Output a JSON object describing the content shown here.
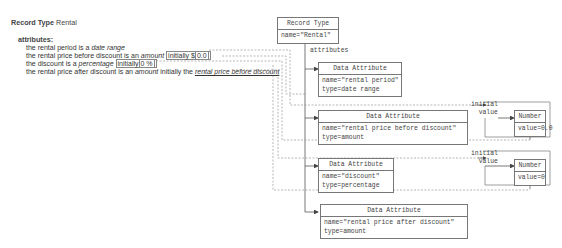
{
  "text_side": {
    "title_prefix": "Record Type",
    "title_name": "Rental",
    "attributes_heading": "attributes:",
    "lines": [
      {
        "pre": "the rental period is a ",
        "type": "date range"
      },
      {
        "pre": "the rental price before discount is an ",
        "type": "amount",
        "initially": "initially $",
        "value": "0.0"
      },
      {
        "pre": "the discount is a ",
        "type": "percentage",
        "initially": "initially",
        "value": "0 %"
      },
      {
        "pre": "the rental price after discount is an ",
        "type": "amount",
        "initially": "initially the ",
        "ref": "rental price before discount"
      }
    ]
  },
  "diagram": {
    "record_type": {
      "header": "Record Type",
      "body": "name=\"Rental\""
    },
    "attributes_label": "attributes",
    "initial_value_label_1": "initial",
    "initial_value_label_2": "value",
    "data_attributes": [
      {
        "header": "Data Attribute",
        "name": "name=\"rental period\"",
        "type": "type=date range"
      },
      {
        "header": "Data Attribute",
        "name": "name=\"rental price before discount\"",
        "type": "type=amount"
      },
      {
        "header": "Data Attribute",
        "name": "name=\"discount\"",
        "type": "type=percentage"
      },
      {
        "header": "Data Attribute",
        "name": "name=\"rental price after discount\"",
        "type": "type=amount"
      }
    ],
    "numbers": [
      {
        "header": "Number",
        "value": "value=0.0"
      },
      {
        "header": "Number",
        "value": "value=0"
      }
    ]
  }
}
